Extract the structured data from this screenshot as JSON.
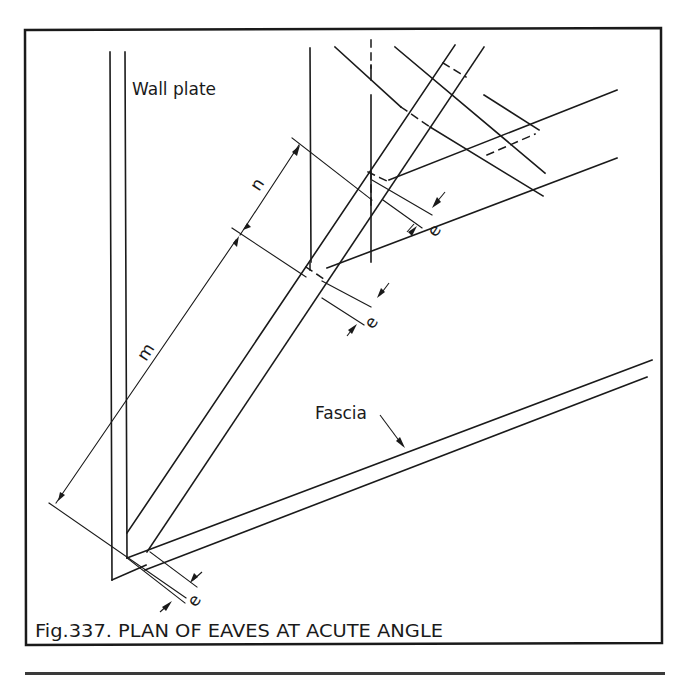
{
  "figure": {
    "caption": "Fig.337. PLAN OF EAVES AT ACUTE ANGLE",
    "labels": {
      "wall_plate": "Wall plate",
      "fascia": "Fascia",
      "dim_n": "n",
      "dim_m": "m",
      "dim_e_upper": "e",
      "dim_e_middle": "e",
      "dim_e_lower": "e"
    },
    "colors": {
      "ink": "#1a1a1a",
      "paper": "#ffffff"
    }
  }
}
